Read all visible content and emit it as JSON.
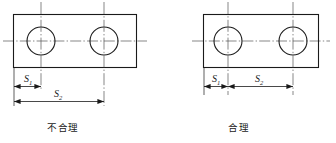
{
  "figure": {
    "line_color": "#1a1a1a",
    "centerline_color": "#555555",
    "background": "#ffffff"
  },
  "panels": [
    {
      "id": "left",
      "caption": "不合理",
      "caption_meaning": "unreasonable",
      "plate": {
        "shape": "rectangle",
        "holes": 2
      },
      "dimensions": [
        {
          "label": "S",
          "subscript": "1",
          "from": "left-edge",
          "to": "hole-1-center"
        },
        {
          "label": "S",
          "subscript": "2",
          "from": "left-edge",
          "to": "hole-2-center"
        }
      ],
      "dimension_style": "baseline-from-common-datum"
    },
    {
      "id": "right",
      "caption": "合理",
      "caption_meaning": "reasonable",
      "plate": {
        "shape": "rectangle",
        "holes": 2
      },
      "dimensions": [
        {
          "label": "S",
          "subscript": "1",
          "from": "left-edge",
          "to": "hole-1-center"
        },
        {
          "label": "S",
          "subscript": "2",
          "from": "hole-1-center",
          "to": "hole-2-center"
        }
      ],
      "dimension_style": "chained"
    }
  ],
  "labels": {
    "s1": "S",
    "s1_sub": "1",
    "s2": "S",
    "s2_sub": "2"
  }
}
